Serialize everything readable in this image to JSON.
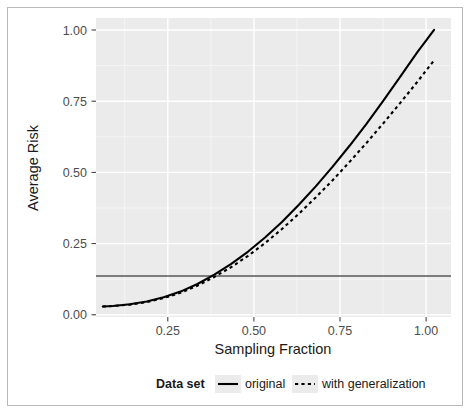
{
  "figure": {
    "border_color": "#b9b9b9",
    "panel_bg": "#ebebeb",
    "grid_major_color": "#ffffff",
    "grid_minor_color": "#f5f5f5"
  },
  "chart_data": {
    "type": "line",
    "title": "",
    "xlabel": "Sampling Fraction",
    "ylabel": "Average Risk",
    "xlim": [
      0.0,
      1.05
    ],
    "ylim": [
      -0.03,
      1.03
    ],
    "xticks": [
      0.25,
      0.5,
      0.75,
      1.0
    ],
    "xticklabels": [
      "0.25",
      "0.50",
      "0.75",
      "1.00"
    ],
    "yticks": [
      0.0,
      0.25,
      0.5,
      0.75,
      1.0
    ],
    "yticklabels": [
      "0.00",
      "0.25",
      "0.50",
      "0.75",
      "1.00"
    ],
    "grid": true,
    "legend_position": "bottom",
    "legend_title": "Data set",
    "series": [
      {
        "name": "original",
        "style": "solid",
        "color": "#000000",
        "x": [
          0.02,
          0.05,
          0.1,
          0.15,
          0.2,
          0.25,
          0.3,
          0.35,
          0.4,
          0.45,
          0.5,
          0.55,
          0.6,
          0.65,
          0.7,
          0.75,
          0.8,
          0.85,
          0.9,
          0.95,
          1.0
        ],
        "y": [
          0.007,
          0.009,
          0.015,
          0.025,
          0.04,
          0.06,
          0.087,
          0.12,
          0.158,
          0.202,
          0.252,
          0.307,
          0.368,
          0.433,
          0.503,
          0.577,
          0.655,
          0.737,
          0.822,
          0.908,
          0.988
        ]
      },
      {
        "name": "with generalization",
        "style": "dashed",
        "color": "#000000",
        "x": [
          0.02,
          0.05,
          0.1,
          0.15,
          0.2,
          0.25,
          0.3,
          0.35,
          0.4,
          0.45,
          0.5,
          0.55,
          0.6,
          0.65,
          0.7,
          0.75,
          0.8,
          0.85,
          0.9,
          0.95,
          1.0
        ],
        "y": [
          0.007,
          0.009,
          0.014,
          0.023,
          0.037,
          0.056,
          0.081,
          0.112,
          0.147,
          0.187,
          0.232,
          0.282,
          0.336,
          0.394,
          0.455,
          0.52,
          0.587,
          0.657,
          0.729,
          0.803,
          0.88
        ]
      }
    ],
    "reference_line": {
      "name": "threshold",
      "orientation": "horizontal",
      "value": 0.115,
      "color": "#595959"
    }
  },
  "legend": {
    "title": "Data set",
    "items": [
      {
        "label": "original",
        "style": "solid"
      },
      {
        "label": "with generalization",
        "style": "dashed"
      }
    ]
  }
}
